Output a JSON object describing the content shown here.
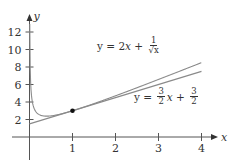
{
  "chart_data": {
    "type": "line",
    "title": "",
    "xlabel": "x",
    "ylabel": "y",
    "xlim": [
      -0.3,
      4.3
    ],
    "ylim": [
      -1.5,
      13.5
    ],
    "x_ticks": [
      1,
      2,
      3,
      4
    ],
    "y_ticks": [
      2,
      4,
      6,
      8,
      10,
      12
    ],
    "grid": false,
    "series": [
      {
        "name": "y = 2x + 1/√x",
        "formula": "2*x + 1/sqrt(x)",
        "x": [
          0.02,
          0.05,
          0.1,
          0.2,
          0.3,
          0.5,
          0.75,
          1,
          1.5,
          2,
          2.5,
          3,
          3.5,
          4
        ],
        "values": [
          7.11,
          4.57,
          3.36,
          2.64,
          2.43,
          2.41,
          2.65,
          3.0,
          3.82,
          4.71,
          5.63,
          6.58,
          7.53,
          8.5
        ]
      },
      {
        "name": "y = (3/2)x + 3/2",
        "formula": "1.5*x + 1.5",
        "x": [
          0,
          4
        ],
        "values": [
          1.5,
          7.5
        ]
      }
    ],
    "points": [
      {
        "x": 1,
        "y": 3,
        "label": "point of tangency"
      }
    ],
    "annotations": [
      {
        "text": "y = 2x + 1/√x",
        "near": [
          2.1,
          8.2
        ]
      },
      {
        "text": "y = (3/2)x + 3/2",
        "near": [
          2.6,
          4.8
        ]
      }
    ]
  },
  "labels": {
    "x_axis": "x",
    "y_axis": "y",
    "x_ticks": [
      "1",
      "2",
      "3",
      "4"
    ],
    "y_ticks": [
      "2",
      "4",
      "6",
      "8",
      "10",
      "12"
    ],
    "eq1": {
      "lhs": "y = 2",
      "var": "x",
      "plus": " + ",
      "num": "1",
      "den": "√x"
    },
    "eq2": {
      "lhs": "y = ",
      "num1": "3",
      "den1": "2",
      "var": "x",
      "plus": " + ",
      "num2": "3",
      "den2": "2"
    }
  },
  "colors": {
    "axis": "#555555",
    "curve": "#8a8a8a",
    "tangent": "#8a8a8a",
    "point": "#111111"
  }
}
